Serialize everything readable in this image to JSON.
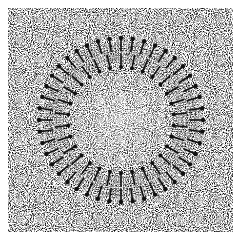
{
  "figure": {
    "background_color": "#ffffff",
    "noise_region": {
      "x": 8,
      "y": 8,
      "width": 225,
      "height": 224
    },
    "ring": {
      "center": [
        121,
        120
      ],
      "outer_head_radius": 82,
      "inner_head_radius": 53,
      "lipid_count_outer": 44,
      "lipid_count_inner": 30,
      "ink_color": "#111111"
    }
  }
}
